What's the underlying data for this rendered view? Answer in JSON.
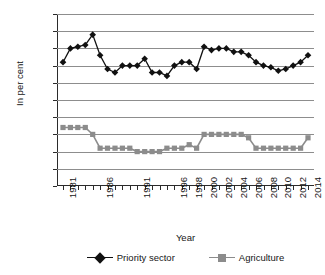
{
  "chart_data": {
    "type": "line",
    "title": "",
    "xlabel": "Year",
    "ylabel": "In per cent",
    "ylim": [
      0,
      50
    ],
    "ytick_step": 5,
    "yticks": [
      0,
      5,
      10,
      15,
      20,
      25,
      30,
      35,
      40,
      45,
      50
    ],
    "grid": true,
    "legend_position": "bottom",
    "x": [
      1981,
      1982,
      1983,
      1984,
      1985,
      1986,
      1987,
      1988,
      1989,
      1990,
      1991,
      1992,
      1993,
      1994,
      1995,
      1996,
      1997,
      1998,
      1999,
      2000,
      2001,
      2002,
      2003,
      2004,
      2005,
      2006,
      2007,
      2008,
      2009,
      2010,
      2011,
      2012,
      2013,
      2014
    ],
    "xtick_labels": [
      "1981",
      "1986",
      "1991",
      "1996",
      "1998",
      "2000",
      "2002",
      "2004",
      "2006",
      "2008",
      "2010",
      "2012",
      "2014"
    ],
    "xtick_values": [
      1981,
      1986,
      1991,
      1996,
      1998,
      2000,
      2002,
      2004,
      2006,
      2008,
      2010,
      2012,
      2014
    ],
    "series": [
      {
        "name": "Priority sector",
        "color": "#111111",
        "marker": "diamond",
        "values": [
          36,
          40,
          40.5,
          41,
          44,
          38,
          34,
          33,
          35,
          35,
          35,
          37,
          33,
          33,
          32,
          35,
          36,
          36,
          34,
          40.5,
          39.5,
          40,
          40,
          39,
          39,
          38,
          36,
          35,
          34.5,
          33.5,
          34,
          35,
          36,
          38
        ]
      },
      {
        "name": "Agriculture",
        "color": "#8c8c8c",
        "marker": "square",
        "values": [
          17,
          17,
          17,
          17,
          15,
          11,
          11,
          11,
          11,
          11,
          10,
          10,
          10,
          10,
          11,
          11,
          11,
          12,
          11,
          15,
          15,
          15,
          15,
          15,
          15,
          14,
          11,
          11,
          11,
          11,
          11,
          11,
          11,
          14
        ]
      }
    ]
  },
  "axes": {
    "y_title": "In per cent",
    "x_title": "Year"
  },
  "legend": {
    "items": [
      {
        "label": "Priority sector",
        "color": "#111111",
        "marker": "diamond"
      },
      {
        "label": "Agriculture",
        "color": "#8c8c8c",
        "marker": "square"
      }
    ]
  }
}
